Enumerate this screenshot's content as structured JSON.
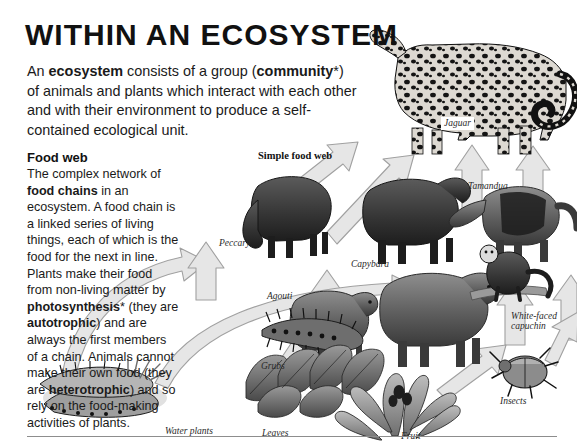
{
  "page": {
    "title": "WITHIN AN ECOSYSTEM",
    "intro_html": "An <b>ecosystem</b> consists of a group (<b>community</b>*) of animals and plants which interact with each other and with their environment to produce a self-contained ecological unit.",
    "section_heading": "Food web",
    "section_body_html": "The complex network of <b>food chains</b> in an ecosystem. A food chain is a linked series of living things, each of which is the food for the next in line. Plants make their food from non-living matter by <b>photosynthesis</b>* (they are <b>autotrophic</b>) and are always the first members of a chain. Animals cannot make their own food (they are <b>heterotrophic</b>) and so rely on the food-making activities of plants."
  },
  "diagram": {
    "caption": "Simple food web",
    "labels": [
      {
        "name": "jaguar",
        "text": "Jaguar",
        "x": 441,
        "y": 117,
        "boxed": true
      },
      {
        "name": "tamandua",
        "text": "Tamandua",
        "x": 468,
        "y": 181,
        "boxed": false
      },
      {
        "name": "peccary",
        "text": "Peccary",
        "x": 219,
        "y": 238,
        "boxed": false
      },
      {
        "name": "capybara",
        "text": "Capybara",
        "x": 351,
        "y": 259,
        "boxed": false
      },
      {
        "name": "agouti",
        "text": "Agouti",
        "x": 267,
        "y": 291,
        "boxed": false
      },
      {
        "name": "white-faced-capuchin",
        "text": "White-faced",
        "x": 511,
        "y": 311,
        "boxed": false
      },
      {
        "name": "white-faced-capuchin2",
        "text": "capuchin",
        "x": 511,
        "y": 321,
        "boxed": false
      },
      {
        "name": "grubs",
        "text": "Grubs",
        "x": 261,
        "y": 361,
        "boxed": false
      },
      {
        "name": "insects",
        "text": "Insects",
        "x": 500,
        "y": 396,
        "boxed": false
      },
      {
        "name": "water-plants",
        "text": "Water plants",
        "x": 165,
        "y": 426,
        "boxed": false
      },
      {
        "name": "leaves",
        "text": "Leaves",
        "x": 262,
        "y": 428,
        "boxed": false
      },
      {
        "name": "fruit",
        "text": "Fruit",
        "x": 401,
        "y": 431,
        "boxed": false
      }
    ],
    "organisms": [
      "Jaguar",
      "Tamandua",
      "Peccary",
      "Capybara",
      "Agouti",
      "White-faced capuchin",
      "Grubs",
      "Insects",
      "Water plants",
      "Leaves",
      "Fruit"
    ],
    "food_chain_links": [
      {
        "from": "Water plants",
        "to": "Peccary"
      },
      {
        "from": "Leaves",
        "to": "Agouti"
      },
      {
        "from": "Grubs",
        "to": "Agouti"
      },
      {
        "from": "Leaves",
        "to": "Capybara"
      },
      {
        "from": "Fruit",
        "to": "Capybara"
      },
      {
        "from": "Fruit",
        "to": "White-faced capuchin"
      },
      {
        "from": "Insects",
        "to": "White-faced capuchin"
      },
      {
        "from": "Insects",
        "to": "Tamandua"
      },
      {
        "from": "Peccary",
        "to": "Jaguar"
      },
      {
        "from": "Agouti",
        "to": "Jaguar"
      },
      {
        "from": "Capybara",
        "to": "Jaguar"
      },
      {
        "from": "Tamandua",
        "to": "Jaguar"
      }
    ]
  },
  "colors": {
    "text": "#1a1a1a",
    "arrow_fill": "#e3e3e3",
    "arrow_stroke": "#9a9a9a",
    "rule": "#8d8d8d"
  }
}
